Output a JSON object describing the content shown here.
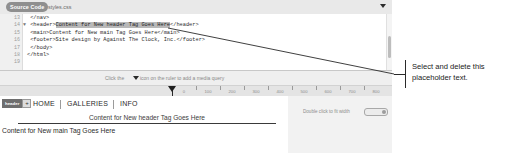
{
  "editor": {
    "tabs": [
      {
        "label": "Source Code",
        "name": "tab-source-code",
        "active": true
      },
      {
        "label": "styles.css",
        "name": "tab-styles-css",
        "active": false
      }
    ],
    "dropdown_icon": "chevron-down-icon",
    "code": {
      "lines": [
        {
          "num": "13",
          "fold": "",
          "segments": [
            {
              "text": "    </nav>",
              "highlight": false
            }
          ]
        },
        {
          "num": "14",
          "fold": "▼",
          "segments": [
            {
              "text": "    <header>",
              "highlight": false
            },
            {
              "text": "Content for New header Tag Goes Here",
              "highlight": true
            },
            {
              "text": "</header>",
              "highlight": false
            }
          ]
        },
        {
          "num": "15",
          "fold": "",
          "segments": [
            {
              "text": "    <main>Content for New main Tag Goes Here</main>",
              "highlight": false
            }
          ]
        },
        {
          "num": "16",
          "fold": "",
          "segments": [
            {
              "text": "    <footer>Site design by Against The Clock, Inc.</footer>",
              "highlight": false
            }
          ]
        },
        {
          "num": "17",
          "fold": "",
          "segments": [
            {
              "text": "  </body>",
              "highlight": false
            }
          ]
        },
        {
          "num": "18",
          "fold": "",
          "segments": [
            {
              "text": "</html>",
              "highlight": false
            }
          ]
        },
        {
          "num": "19",
          "fold": "",
          "segments": [
            {
              "text": "",
              "highlight": false
            }
          ]
        }
      ]
    },
    "media_query_hint": {
      "text_before": "Click the",
      "icon": "triangle-down-icon",
      "text_after": "icon on the ruler to add a media query"
    },
    "ruler": {
      "ticks": [
        {
          "pos_px": 172,
          "label": "0"
        },
        {
          "pos_px": 196,
          "label": "100"
        },
        {
          "pos_px": 220,
          "label": "200"
        },
        {
          "pos_px": 244,
          "label": "300"
        },
        {
          "pos_px": 268,
          "label": "400"
        },
        {
          "pos_px": 292,
          "label": "500"
        },
        {
          "pos_px": 316,
          "label": "600"
        },
        {
          "pos_px": 340,
          "label": "700"
        },
        {
          "pos_px": 364,
          "label": "800"
        }
      ],
      "marker_icon": "media-query-marker-icon"
    }
  },
  "preview": {
    "tag_badge": {
      "label": "header",
      "add_label": "+"
    },
    "nav_links": [
      {
        "label": "HOME",
        "left_px": 33
      },
      {
        "label": "GALLERIES",
        "left_px": 67
      },
      {
        "label": "INFO",
        "left_px": 120
      }
    ],
    "nav_separators": [
      60,
      113
    ],
    "header_text": "Content for New header Tag Goes Here",
    "main_text": "Content for New main Tag Goes Here",
    "fit_width_hint": "Double click to fit width",
    "fit_width_control": "width-slider-pill"
  },
  "callout": {
    "text": "Select and delete this placeholder text.",
    "leader_icon": "leader-line"
  }
}
